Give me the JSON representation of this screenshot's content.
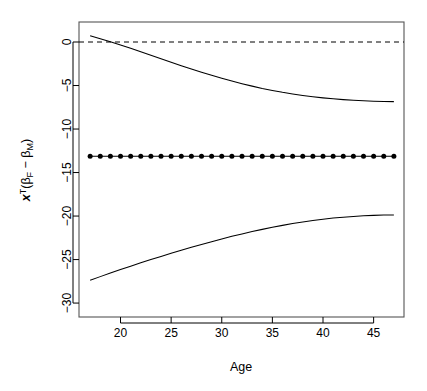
{
  "chart_data": {
    "type": "line",
    "title": "",
    "xlabel": "Age",
    "ylabel_parts": {
      "x": "x",
      "sup": "T",
      "open": "(β",
      "sub1": "F",
      "minus": " − β",
      "sub2": "M",
      "close": ")"
    },
    "ylabel_plain": "x^T(β_F − β_M)",
    "xlim": [
      15.9,
      48.0
    ],
    "ylim": [
      -31.6,
      2.3
    ],
    "xticks": [
      20,
      25,
      30,
      35,
      40,
      45
    ],
    "xtick_labels": [
      "20",
      "25",
      "30",
      "35",
      "40",
      "45"
    ],
    "yticks": [
      0,
      -5,
      -10,
      -15,
      -20,
      -25,
      -30
    ],
    "ytick_labels": [
      "0",
      "-5",
      "-10",
      "-15",
      "-20",
      "-25",
      "-30"
    ],
    "grid": false,
    "legend": null,
    "reference_line": {
      "y": 0,
      "style": "dashed"
    },
    "x": [
      17,
      18,
      19,
      20,
      21,
      22,
      23,
      24,
      25,
      26,
      27,
      28,
      29,
      30,
      31,
      32,
      33,
      34,
      35,
      36,
      37,
      38,
      39,
      40,
      41,
      42,
      43,
      44,
      45,
      46,
      47
    ],
    "series": [
      {
        "name": "upper confidence band",
        "style": "solid-line",
        "values": [
          0.72,
          0.37,
          0.02,
          -0.35,
          -0.72,
          -1.12,
          -1.52,
          -1.93,
          -2.33,
          -2.72,
          -3.1,
          -3.47,
          -3.83,
          -4.17,
          -4.49,
          -4.79,
          -5.07,
          -5.33,
          -5.56,
          -5.78,
          -5.97,
          -6.14,
          -6.29,
          -6.42,
          -6.53,
          -6.62,
          -6.7,
          -6.76,
          -6.8,
          -6.83,
          -6.85
        ]
      },
      {
        "name": "point estimate",
        "style": "line-with-points",
        "values": [
          -13.12,
          -13.12,
          -13.12,
          -13.12,
          -13.12,
          -13.12,
          -13.12,
          -13.12,
          -13.12,
          -13.12,
          -13.12,
          -13.12,
          -13.12,
          -13.12,
          -13.12,
          -13.12,
          -13.12,
          -13.12,
          -13.12,
          -13.12,
          -13.12,
          -13.12,
          -13.12,
          -13.12,
          -13.12,
          -13.12,
          -13.12,
          -13.12,
          -13.12,
          -13.12,
          -13.12
        ]
      },
      {
        "name": "lower confidence band",
        "style": "solid-line",
        "values": [
          -27.38,
          -26.96,
          -26.55,
          -26.15,
          -25.76,
          -25.38,
          -25.0,
          -24.64,
          -24.28,
          -23.93,
          -23.59,
          -23.26,
          -22.94,
          -22.63,
          -22.33,
          -22.05,
          -21.78,
          -21.53,
          -21.29,
          -21.07,
          -20.86,
          -20.68,
          -20.51,
          -20.36,
          -20.23,
          -20.13,
          -20.04,
          -19.97,
          -19.92,
          -19.89,
          -19.88
        ]
      }
    ]
  }
}
